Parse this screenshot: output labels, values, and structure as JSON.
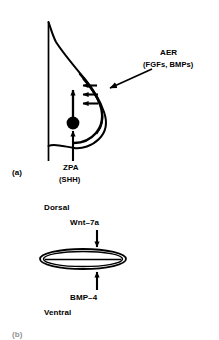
{
  "figure": {
    "top_clipped_text": "",
    "panels": [
      {
        "tag": "(a)",
        "name": "limb-bud-lateral-view",
        "labels": {
          "aer_title": "AER",
          "aer_factors": "(FGFs, BMPs)",
          "zpa_title": "ZPA",
          "zpa_factor": "(SHH)"
        },
        "arrows": {
          "aer_pointer": "pointer-arrow-to-aer",
          "aer_signal_count": 3,
          "zpa_signal": "upward-arrow-from-zpa",
          "zpa_leader": "leader-arrow-to-zpa"
        },
        "structures": {
          "body_wall": "vertical-body-wall-line",
          "bud_outline": "limb-bud-outline",
          "aer_ridge": "apical-ectodermal-ridge",
          "zpa_node": "zone-of-polarizing-activity"
        }
      },
      {
        "tag": "(b)",
        "name": "limb-bud-cross-section",
        "labels": {
          "dorsal": "Dorsal",
          "dorsal_factor": "Wnt–7a",
          "ventral": "Ventral",
          "ventral_factor": "BMP–4"
        },
        "arrows": {
          "dorsal_arrow": "downward-arrow-wnt7a",
          "ventral_arrow": "upward-arrow-bmp4"
        },
        "structures": {
          "cross_section": "flattened-ellipse-cross-section"
        }
      }
    ]
  },
  "style": {
    "ink": "#000000",
    "paper": "#ffffff"
  }
}
